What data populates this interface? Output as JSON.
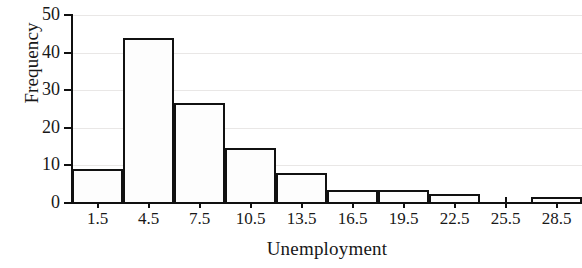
{
  "chart_data": {
    "type": "bar",
    "chart_subtype": "histogram",
    "title": "",
    "xlabel": "Unemployment",
    "ylabel": "Frequency",
    "categories": [
      "1.5",
      "4.5",
      "7.5",
      "10.5",
      "13.5",
      "16.5",
      "19.5",
      "22.5",
      "25.5",
      "28.5"
    ],
    "values": [
      9,
      44,
      26.5,
      14.5,
      8,
      3.5,
      3.5,
      2.5,
      0,
      1.5
    ],
    "bin_width": 3,
    "bin_centers": [
      1.5,
      4.5,
      7.5,
      10.5,
      13.5,
      16.5,
      19.5,
      22.5,
      25.5,
      28.5
    ],
    "xlim": [
      0,
      30
    ],
    "ylim": [
      0,
      50
    ],
    "xticks": [
      "1.5",
      "4.5",
      "7.5",
      "10.5",
      "13.5",
      "16.5",
      "19.5",
      "22.5",
      "25.5",
      "28.5"
    ],
    "yticks": [
      "0",
      "10",
      "20",
      "30",
      "40",
      "50"
    ],
    "ytick_values": [
      0,
      10,
      20,
      30,
      40,
      50
    ],
    "grid": "horizontal",
    "legend": "none",
    "bar_fill_color": "#fdfdfd",
    "bar_edge_color": "#111111",
    "grid_color": "#e9e7e6",
    "axis_color": "#101010"
  }
}
